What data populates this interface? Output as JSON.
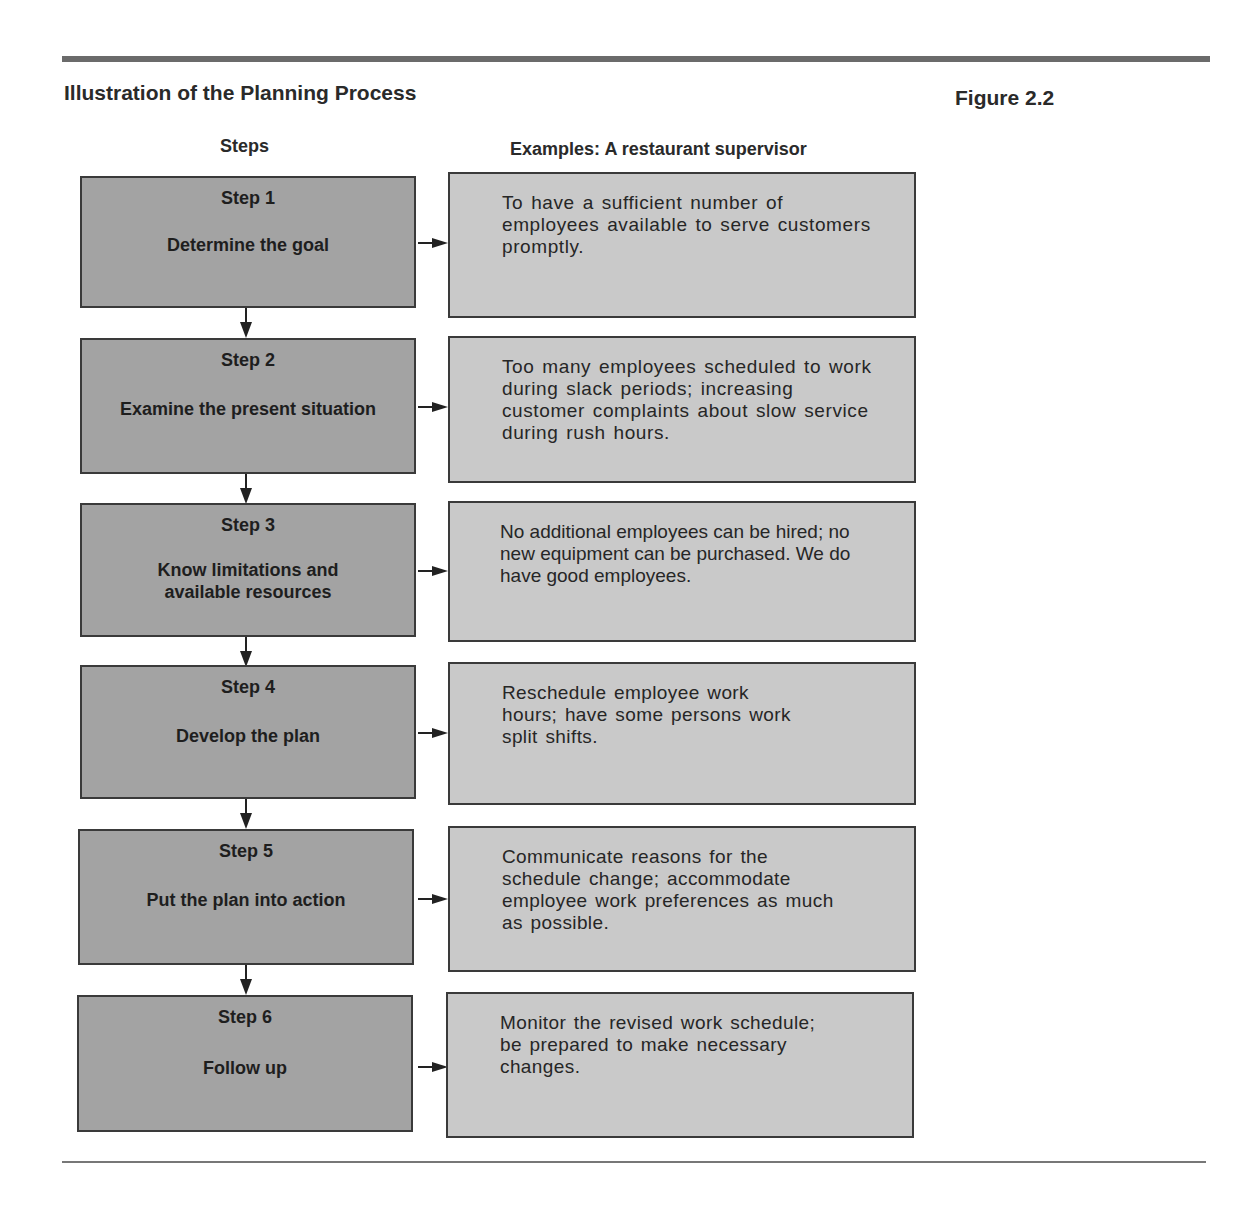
{
  "header": {
    "title": "Illustration of the Planning Process",
    "figure_label": "Figure 2.2"
  },
  "columns": {
    "steps": "Steps",
    "examples": "Examples:  A restaurant supervisor"
  },
  "steps": [
    {
      "number": "Step 1",
      "label": "Determine the goal",
      "example": "To have a sufficient number of employees available to serve customers promptly."
    },
    {
      "number": "Step 2",
      "label": "Examine the present situation",
      "example": "Too many employees scheduled to work during slack periods; increasing customer complaints about slow service during rush hours."
    },
    {
      "number": "Step 3",
      "label": "Know limitations and available resources",
      "example": "No additional employees can be hired; no new equipment can be purchased. We do have good employees."
    },
    {
      "number": "Step 4",
      "label": "Develop the plan",
      "example": "Reschedule employee work hours; have some persons work split shifts."
    },
    {
      "number": "Step 5",
      "label": "Put the plan into action",
      "example": "Communicate reasons for the schedule change; accommodate employee work preferences as much as possible."
    },
    {
      "number": "Step 6",
      "label": "Follow up",
      "example": "Monitor the revised work schedule; be prepared to make necessary changes."
    }
  ],
  "colors": {
    "step_box": "#a3a3a3",
    "example_box": "#c9c9c9",
    "border": "#3a3a3a",
    "rule": "#6b6b6b"
  }
}
